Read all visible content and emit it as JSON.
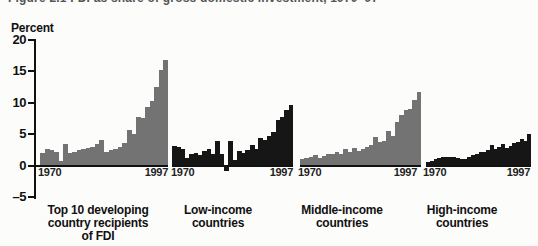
{
  "figure": {
    "clipped_title": "Figure 2.1   FDI as share of gross domestic investment, 1970–97",
    "y_axis_label": "Percent"
  },
  "chart_data": {
    "type": "bar",
    "title": "FDI as share of gross domestic investment, 1970–97",
    "ylabel": "Percent",
    "ylim": [
      -5,
      20
    ],
    "y_tick_labels": [
      "20",
      "15",
      "10",
      "5",
      "0",
      "–5"
    ],
    "y_tick_values": [
      20,
      15,
      10,
      5,
      0,
      -5
    ],
    "x_start_label": "1970",
    "x_end_label": "1997",
    "years_start": 1970,
    "years_end": 1997,
    "grid": false,
    "legend": "none",
    "panels": [
      {
        "name": "Top 10 developing country recipients of FDI",
        "label_lines": [
          "Top 10 developing",
          "country recipients",
          "of FDI"
        ],
        "color": "#737373",
        "values": [
          2.0,
          2.6,
          2.4,
          2.2,
          0.7,
          3.5,
          2.0,
          2.2,
          2.4,
          2.6,
          2.8,
          3.0,
          3.4,
          4.0,
          2.2,
          2.4,
          2.6,
          3.0,
          3.6,
          5.6,
          5.0,
          7.8,
          7.5,
          9.3,
          10.3,
          12.5,
          15.2,
          16.8
        ]
      },
      {
        "name": "Low-income countries",
        "label_lines": [
          "Low-income",
          "countries"
        ],
        "color": "#161616",
        "values": [
          3.1,
          2.9,
          2.6,
          1.2,
          1.9,
          2.0,
          1.6,
          2.3,
          2.6,
          1.8,
          3.9,
          1.9,
          -0.8,
          3.9,
          0.9,
          2.3,
          2.0,
          2.4,
          3.3,
          2.6,
          4.4,
          4.1,
          4.7,
          5.4,
          7.2,
          7.7,
          8.8,
          9.6
        ]
      },
      {
        "name": "Middle-income countries",
        "label_lines": [
          "Middle-income",
          "countries"
        ],
        "color": "#737373",
        "values": [
          1.1,
          1.2,
          1.3,
          1.6,
          1.2,
          1.5,
          1.8,
          1.9,
          2.2,
          1.8,
          2.6,
          2.2,
          2.8,
          2.3,
          2.7,
          3.0,
          3.2,
          4.5,
          3.7,
          3.9,
          5.5,
          4.7,
          6.9,
          8.0,
          8.8,
          9.0,
          10.4,
          11.7
        ]
      },
      {
        "name": "High-income countries",
        "label_lines": [
          "High-income",
          "countries"
        ],
        "color": "#161616",
        "values": [
          0.6,
          0.7,
          1.0,
          1.2,
          1.4,
          1.4,
          1.3,
          1.4,
          1.2,
          1.0,
          1.1,
          1.4,
          1.6,
          1.9,
          2.1,
          2.2,
          2.4,
          3.2,
          2.6,
          3.0,
          3.4,
          2.8,
          3.1,
          3.6,
          3.8,
          4.2,
          3.9,
          5.0
        ]
      }
    ],
    "colors": {
      "gray_bars": "#737373",
      "black_bars": "#161616",
      "axis": "#111111",
      "background": "#fcfcfb"
    }
  }
}
